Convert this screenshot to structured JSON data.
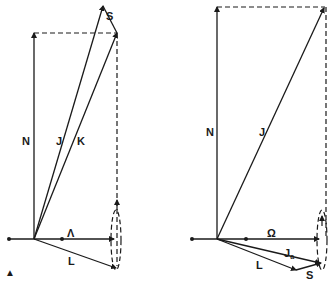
{
  "figure": {
    "left_panel": {
      "labels": {
        "N": "N",
        "J": "J",
        "K": "K",
        "S": "S",
        "Lambda": "Λ",
        "L": "L"
      },
      "corner_mark": "▲"
    },
    "right_panel": {
      "labels": {
        "N": "N",
        "J": "J",
        "Omega": "Ω",
        "Ja_main": "J",
        "Ja_sub": "a",
        "L": "L",
        "S": "S"
      }
    },
    "colors": {
      "ink": "#1a1a1a",
      "background": "#ffffff"
    }
  }
}
